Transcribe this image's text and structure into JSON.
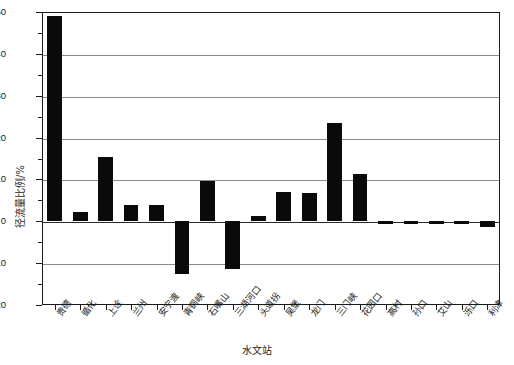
{
  "chart_data": {
    "type": "bar",
    "title": "",
    "xlabel": "水文站",
    "ylabel": "径流量比例/%",
    "ylim": [
      -20,
      50
    ],
    "yticks": [
      50,
      40,
      30,
      20,
      10,
      0,
      -10,
      -20
    ],
    "ytick_labels": [
      "50",
      "40",
      "30",
      "20",
      "10",
      "0",
      "-10",
      "-20"
    ],
    "grid": true,
    "grid_axis": "y",
    "legend": "none",
    "bar_color": "#0a0a0a",
    "categories": [
      "贵德",
      "循化",
      "上诠",
      "兰州",
      "安宁渡",
      "青铜峡",
      "石嘴山",
      "三湖河口",
      "头道拐",
      "吴堡",
      "龙门",
      "三门峡",
      "花园口",
      "高村",
      "孙口",
      "艾山",
      "泺口",
      "利津"
    ],
    "values": [
      49.0,
      2.2,
      15.3,
      4.0,
      4.0,
      -12.5,
      9.7,
      -11.5,
      1.2,
      7.0,
      6.8,
      23.5,
      11.3,
      -0.7,
      -0.6,
      -0.7,
      -0.6,
      -1.3
    ]
  },
  "axes": {
    "y_axis_title": "径流量比例/%",
    "x_axis_title": "水文站"
  }
}
